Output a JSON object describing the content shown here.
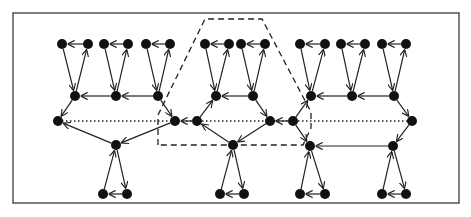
{
  "diagram": {
    "type": "directed-graph",
    "frame": {
      "x": 13,
      "y": 13,
      "w": 446,
      "h": 190,
      "stroke": "#555555"
    },
    "colors": {
      "node": "#111111",
      "edge": "#222222",
      "dotted": "#222222",
      "dashed": "#222222"
    },
    "node_radius": 5,
    "nodes": [
      {
        "id": "t1a",
        "x": 62,
        "y": 44
      },
      {
        "id": "t1b",
        "x": 88,
        "y": 44
      },
      {
        "id": "t2a",
        "x": 104,
        "y": 44
      },
      {
        "id": "t2b",
        "x": 128,
        "y": 44
      },
      {
        "id": "t3a",
        "x": 146,
        "y": 44
      },
      {
        "id": "t3b",
        "x": 170,
        "y": 44
      },
      {
        "id": "t4a",
        "x": 205,
        "y": 44
      },
      {
        "id": "t4b",
        "x": 229,
        "y": 44
      },
      {
        "id": "t5a",
        "x": 241,
        "y": 44
      },
      {
        "id": "t5b",
        "x": 265,
        "y": 44
      },
      {
        "id": "t6a",
        "x": 300,
        "y": 44
      },
      {
        "id": "t6b",
        "x": 325,
        "y": 44
      },
      {
        "id": "t7a",
        "x": 341,
        "y": 44
      },
      {
        "id": "t7b",
        "x": 365,
        "y": 44
      },
      {
        "id": "t8a",
        "x": 382,
        "y": 44
      },
      {
        "id": "t8b",
        "x": 406,
        "y": 44
      },
      {
        "id": "h1",
        "x": 75,
        "y": 96
      },
      {
        "id": "h2",
        "x": 116,
        "y": 96
      },
      {
        "id": "h3",
        "x": 158,
        "y": 96
      },
      {
        "id": "h4",
        "x": 216,
        "y": 96
      },
      {
        "id": "h5",
        "x": 253,
        "y": 96
      },
      {
        "id": "h6",
        "x": 311,
        "y": 96
      },
      {
        "id": "h7",
        "x": 352,
        "y": 96
      },
      {
        "id": "h8",
        "x": 394,
        "y": 96
      },
      {
        "id": "m1",
        "x": 58,
        "y": 121
      },
      {
        "id": "m2",
        "x": 175,
        "y": 121
      },
      {
        "id": "m3",
        "x": 197,
        "y": 121
      },
      {
        "id": "m4",
        "x": 270,
        "y": 121
      },
      {
        "id": "m5",
        "x": 293,
        "y": 121
      },
      {
        "id": "m6",
        "x": 412,
        "y": 121
      },
      {
        "id": "l1",
        "x": 116,
        "y": 145
      },
      {
        "id": "l2",
        "x": 233,
        "y": 145
      },
      {
        "id": "l3",
        "x": 310,
        "y": 146
      },
      {
        "id": "l4",
        "x": 393,
        "y": 146
      },
      {
        "id": "b1a",
        "x": 103,
        "y": 194
      },
      {
        "id": "b1b",
        "x": 127,
        "y": 194
      },
      {
        "id": "b2a",
        "x": 220,
        "y": 194
      },
      {
        "id": "b2b",
        "x": 244,
        "y": 194
      },
      {
        "id": "b3a",
        "x": 300,
        "y": 194
      },
      {
        "id": "b3b",
        "x": 325,
        "y": 194
      },
      {
        "id": "b4a",
        "x": 382,
        "y": 194
      },
      {
        "id": "b4b",
        "x": 406,
        "y": 194
      }
    ],
    "edges": [
      {
        "from": "t1b",
        "to": "t1a"
      },
      {
        "from": "t1a",
        "to": "h1"
      },
      {
        "from": "h1",
        "to": "t1b"
      },
      {
        "from": "t2b",
        "to": "t2a"
      },
      {
        "from": "t2a",
        "to": "h2"
      },
      {
        "from": "h2",
        "to": "t2b"
      },
      {
        "from": "t3b",
        "to": "t3a"
      },
      {
        "from": "t3a",
        "to": "h3"
      },
      {
        "from": "h3",
        "to": "t3b"
      },
      {
        "from": "t4b",
        "to": "t4a"
      },
      {
        "from": "t4a",
        "to": "h4"
      },
      {
        "from": "h4",
        "to": "t4b"
      },
      {
        "from": "t5b",
        "to": "t5a"
      },
      {
        "from": "t5a",
        "to": "h5"
      },
      {
        "from": "h5",
        "to": "t5b"
      },
      {
        "from": "t6b",
        "to": "t6a"
      },
      {
        "from": "t6a",
        "to": "h6"
      },
      {
        "from": "h6",
        "to": "t6b"
      },
      {
        "from": "t7b",
        "to": "t7a"
      },
      {
        "from": "t7a",
        "to": "h7"
      },
      {
        "from": "h7",
        "to": "t7b"
      },
      {
        "from": "t8b",
        "to": "t8a"
      },
      {
        "from": "t8a",
        "to": "h8"
      },
      {
        "from": "h8",
        "to": "t8b"
      },
      {
        "from": "h2",
        "to": "h1"
      },
      {
        "from": "h3",
        "to": "h2"
      },
      {
        "from": "h5",
        "to": "h4"
      },
      {
        "from": "h7",
        "to": "h6"
      },
      {
        "from": "h8",
        "to": "h7"
      },
      {
        "from": "h1",
        "to": "m1"
      },
      {
        "from": "h3",
        "to": "m2"
      },
      {
        "from": "m3",
        "to": "h4"
      },
      {
        "from": "h5",
        "to": "m4"
      },
      {
        "from": "m5",
        "to": "h6"
      },
      {
        "from": "h8",
        "to": "m6"
      },
      {
        "from": "m3",
        "to": "m2"
      },
      {
        "from": "m5",
        "to": "m4"
      },
      {
        "from": "l1",
        "to": "m1"
      },
      {
        "from": "m2",
        "to": "l1"
      },
      {
        "from": "l2",
        "to": "m3"
      },
      {
        "from": "m4",
        "to": "l2"
      },
      {
        "from": "m5",
        "to": "l3"
      },
      {
        "from": "m6",
        "to": "l4"
      },
      {
        "from": "l4",
        "to": "l3"
      },
      {
        "from": "b1b",
        "to": "b1a"
      },
      {
        "from": "b1a",
        "to": "l1"
      },
      {
        "from": "l1",
        "to": "b1b"
      },
      {
        "from": "b2b",
        "to": "b2a"
      },
      {
        "from": "b2a",
        "to": "l2"
      },
      {
        "from": "l2",
        "to": "b2b"
      },
      {
        "from": "b3b",
        "to": "b3a"
      },
      {
        "from": "b3a",
        "to": "l3"
      },
      {
        "from": "l3",
        "to": "b3b"
      },
      {
        "from": "b4b",
        "to": "b4a"
      },
      {
        "from": "b4a",
        "to": "l4"
      },
      {
        "from": "l4",
        "to": "b4b"
      }
    ],
    "dotted_edges": [
      {
        "from": "m2",
        "to": "m1"
      },
      {
        "from": "m5",
        "to": "m6"
      }
    ],
    "dotted_line": {
      "x1": 58,
      "y1": 121,
      "x2": 412,
      "y2": 121
    },
    "dashed_region": {
      "points": [
        [
          158,
          145
        ],
        [
          158,
          115
        ],
        [
          205,
          19
        ],
        [
          262,
          19
        ],
        [
          311,
          112
        ],
        [
          311,
          128
        ],
        [
          303,
          145
        ]
      ]
    }
  }
}
